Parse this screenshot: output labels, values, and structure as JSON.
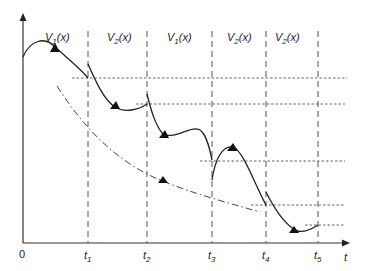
{
  "diagram": {
    "axes": {
      "origin_label": "0",
      "x_axis_label": "t",
      "ticks": [
        {
          "name": "t",
          "sub": "1"
        },
        {
          "name": "t",
          "sub": "2"
        },
        {
          "name": "t",
          "sub": "3"
        },
        {
          "name": "t",
          "sub": "4"
        },
        {
          "name": "t",
          "sub": "5"
        }
      ]
    },
    "intervals": [
      {
        "v": "V",
        "sub": "1",
        "arg": "(x)"
      },
      {
        "v": "V",
        "sub": "2",
        "arg": "(x)"
      },
      {
        "v": "V",
        "sub": "1",
        "arg": "(x)"
      },
      {
        "v": "V",
        "sub": "2",
        "arg": "(x)"
      },
      {
        "v": "V",
        "sub": "2",
        "arg": "(x)"
      }
    ],
    "colors": {
      "curve": "#222222",
      "grid": "#555555",
      "axis": "#333333"
    }
  }
}
